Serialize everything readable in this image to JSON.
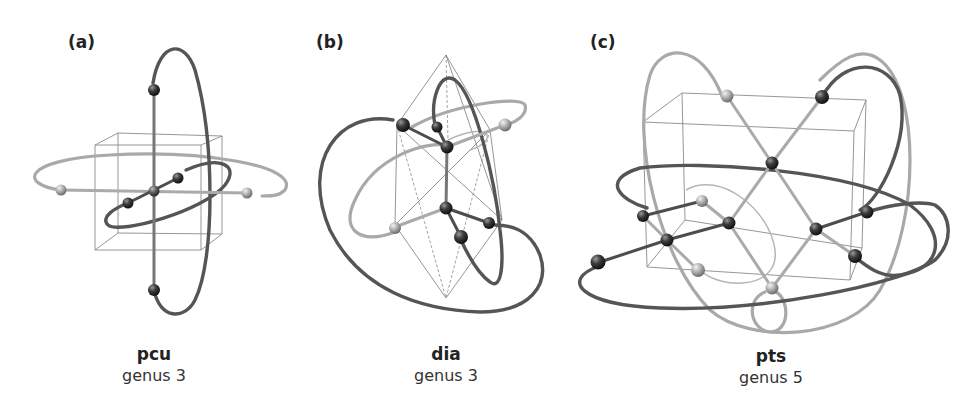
{
  "figure": {
    "panels": [
      {
        "id": "a",
        "label": "(a)",
        "net_name": "pcu",
        "genus_text": "genus 3",
        "cell": "cube"
      },
      {
        "id": "b",
        "label": "(b)",
        "net_name": "dia",
        "genus_text": "genus 3",
        "cell": "rhombohedron"
      },
      {
        "id": "c",
        "label": "(c)",
        "net_name": "pts",
        "genus_text": "genus 5",
        "cell": "tetragonal-box"
      }
    ]
  },
  "colors": {
    "background": "#ffffff",
    "light_edge": "#a9a9a9",
    "dark_edge": "#555555",
    "cell_outline": "#8a8a8a",
    "node_light": "#bdbdbd",
    "node_dark": "#3a3a3a",
    "text": "#222222"
  }
}
